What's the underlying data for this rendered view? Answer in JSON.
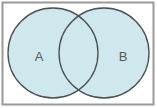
{
  "diagram": {
    "type": "venn",
    "sets": [
      {
        "label": "A",
        "cx": 53,
        "cy": 53,
        "r": 45
      },
      {
        "label": "B",
        "cx": 104,
        "cy": 53,
        "r": 45
      }
    ],
    "colors": {
      "fill": "#cfe8ee",
      "stroke": "#4a4f52",
      "frame": "#9a9a9a",
      "label": "#555a5c",
      "background": "#ffffff"
    }
  }
}
